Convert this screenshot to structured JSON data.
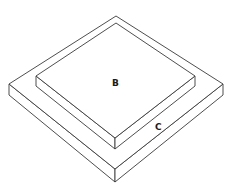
{
  "diagram": {
    "labels": {
      "upper_slab": "B",
      "base_slab": "C"
    },
    "colors": {
      "stroke": "#3a3a3a",
      "fill": "#ffffff",
      "label": "#1a1a1a"
    },
    "shapes": {
      "base_c": {
        "top_face": [
          [
            116,
            16
          ],
          [
            223,
            84
          ],
          [
            115,
            169
          ],
          [
            9,
            84
          ]
        ],
        "thickness": 10
      },
      "slab_b": {
        "top_face": [
          [
            116,
            23
          ],
          [
            195,
            76
          ],
          [
            115,
            138
          ],
          [
            36,
            76
          ]
        ],
        "thickness": 10
      }
    }
  }
}
